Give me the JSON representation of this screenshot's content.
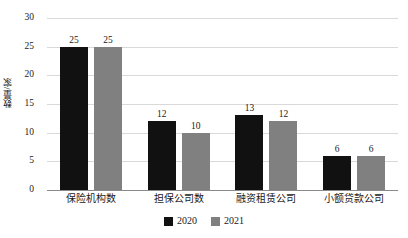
{
  "chart_data": {
    "type": "bar",
    "title": "",
    "subtitle": "",
    "xlabel": "",
    "ylabel": "数量/家",
    "categories": [
      "保险机构数",
      "担保公司数",
      "融资租赁公司",
      "小额贷款公司"
    ],
    "series": [
      {
        "name": "2020",
        "color": "#111111",
        "values": [
          25,
          12,
          13,
          6
        ]
      },
      {
        "name": "2021",
        "color": "#808080",
        "values": [
          25,
          10,
          12,
          6
        ]
      }
    ],
    "ylim": [
      0,
      30
    ],
    "y_ticks": [
      0,
      5,
      10,
      15,
      20,
      25,
      30
    ],
    "y_tick_labels": [
      "0",
      "5",
      "10",
      "15",
      "20",
      "25",
      "30"
    ],
    "grid": true,
    "grid_axis": "y",
    "legend_position": "bottom",
    "data_labels": true,
    "background_color": "#ffffff",
    "gridline_color": "#d9d9d9",
    "axis_color": "#8a8a8a"
  }
}
